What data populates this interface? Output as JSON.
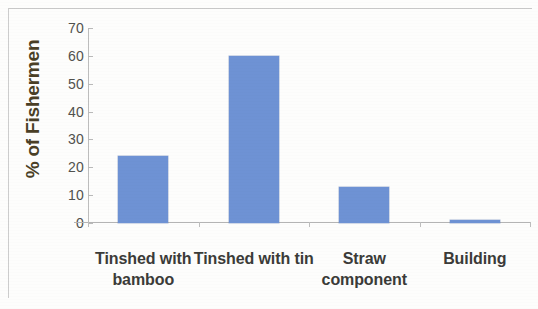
{
  "chart_data": {
    "type": "bar",
    "title": "",
    "xlabel": "",
    "ylabel": "% of Fishermen",
    "categories": [
      "Tinshed with bamboo",
      "Tinshed with tin",
      "Straw component",
      "Building"
    ],
    "values": [
      24,
      60,
      13,
      1
    ],
    "ylim": [
      0,
      70
    ],
    "yticks": [
      0,
      10,
      20,
      30,
      40,
      50,
      60,
      70
    ],
    "ytick_labels": [
      "0",
      "10",
      "20",
      "30",
      "40",
      "50",
      "60",
      "70"
    ],
    "grid": false,
    "legend": "none",
    "series": [
      {
        "name": "% of Fishermen",
        "color": "#6e92d4",
        "values": [
          24,
          60,
          13,
          1
        ]
      }
    ],
    "colors": {
      "bar": "#6e92d4",
      "axis": "#b9b9b9",
      "tick_text": "#51514d",
      "category_text": "#3b3b38",
      "axis_title": "#4a3f26",
      "background": "#fdfdfc"
    }
  },
  "axis": {
    "y_title": "% of Fishermen"
  }
}
